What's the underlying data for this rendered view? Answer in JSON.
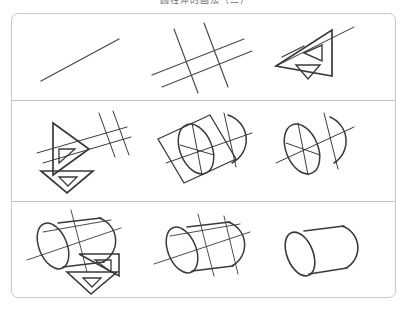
{
  "page": {
    "caption": "圆柱体的画法（二）",
    "background_color": "#ffffff",
    "sheet_border_color": "#c9c9c9",
    "ink_color": "#3a3a3a",
    "construction_line_color": "#6e6e6e"
  },
  "diagram": {
    "type": "instructional-grid",
    "rows": 3,
    "columns": 3,
    "steps": [
      {
        "index": 1,
        "row": 1,
        "column": 1,
        "name": "single-guide-line",
        "label": "Step 1",
        "description": "A single light diagonal construction line is drawn across the sheet."
      },
      {
        "index": 2,
        "row": 1,
        "column": 2,
        "name": "crossed-guide-lines",
        "label": "Step 2",
        "description": "Two pairs of crossing diagonal construction lines form a skewed grid."
      },
      {
        "index": 3,
        "row": 1,
        "column": 3,
        "name": "set-square-on-line",
        "label": "Step 3",
        "description": "A drafting set square with two triangular cut-outs is aligned along the guide line."
      },
      {
        "index": 4,
        "row": 2,
        "column": 1,
        "name": "set-square-rotated-with-lines",
        "label": "Step 4",
        "description": "The set square is rotated and crossing guide lines are extended from its edge."
      },
      {
        "index": 5,
        "row": 2,
        "column": 2,
        "name": "square-with-inscribed-ellipse",
        "label": "Step 5",
        "description": "A skewed square is drawn around an inscribed ellipse, with a partial arc alongside."
      },
      {
        "index": 6,
        "row": 2,
        "column": 3,
        "name": "ellipse-and-arc",
        "label": "Step 6",
        "description": "The construction square is erased leaving the ellipse, its axes and the end arc."
      },
      {
        "index": 7,
        "row": 3,
        "column": 1,
        "name": "cylinder-with-set-square",
        "label": "Step 7",
        "description": "The cylinder body is drawn while the set square guides the parallel sides."
      },
      {
        "index": 8,
        "row": 3,
        "column": 2,
        "name": "cylinder-with-construction-lines",
        "label": "Step 8",
        "description": "The full cylinder outline is complete with construction lines still visible."
      },
      {
        "index": 9,
        "row": 3,
        "column": 3,
        "name": "finished-cylinder",
        "label": "Step 9",
        "description": "The finished cylinder drawing with all construction lines erased."
      }
    ]
  }
}
